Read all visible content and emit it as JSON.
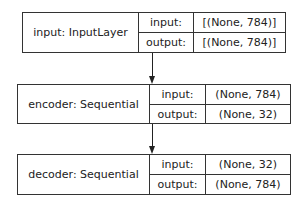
{
  "diagram": {
    "type": "keras-model-plot",
    "nodes": [
      {
        "name": "input: InputLayer",
        "input_label": "input:",
        "input_shape": "[(None, 784)]",
        "output_label": "output:",
        "output_shape": "[(None, 784)]"
      },
      {
        "name": "encoder: Sequential",
        "input_label": "input:",
        "input_shape": "(None, 784)",
        "output_label": "output:",
        "output_shape": "(None, 32)"
      },
      {
        "name": "decoder: Sequential",
        "input_label": "input:",
        "input_shape": "(None, 32)",
        "output_label": "output:",
        "output_shape": "(None, 784)"
      }
    ],
    "edges": [
      {
        "from": "input: InputLayer",
        "to": "encoder: Sequential"
      },
      {
        "from": "encoder: Sequential",
        "to": "decoder: Sequential"
      }
    ],
    "colors": {
      "line": "#333333",
      "background": "#ffffff",
      "text": "#222222"
    }
  }
}
